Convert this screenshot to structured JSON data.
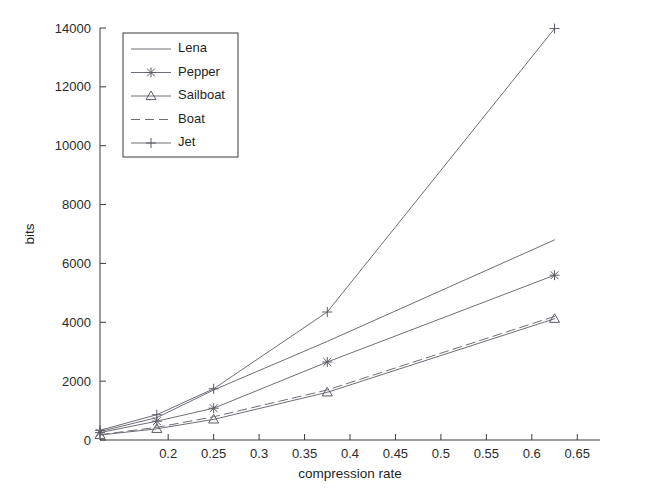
{
  "chart_data": {
    "type": "line",
    "title": "",
    "xlabel": "compression rate",
    "ylabel": "bits",
    "xlim": [
      0.125,
      0.675
    ],
    "ylim": [
      0,
      14000
    ],
    "xticks": [
      0.2,
      0.25,
      0.3,
      0.35,
      0.4,
      0.45,
      0.5,
      0.55,
      0.6,
      0.65
    ],
    "xtick_labels": [
      "0.2",
      "0.25",
      "0.3",
      "0.35",
      "0.4",
      "0.45",
      "0.5",
      "0.55",
      "0.6",
      "0.65"
    ],
    "yticks": [
      0,
      2000,
      4000,
      6000,
      8000,
      10000,
      12000,
      14000
    ],
    "ytick_labels": [
      "0",
      "2000",
      "4000",
      "6000",
      "8000",
      "10000",
      "12000",
      "14000"
    ],
    "grid": false,
    "legend_position": "upper-left",
    "x": [
      0.125,
      0.1875,
      0.25,
      0.375,
      0.625
    ],
    "series": [
      {
        "name": "Lena",
        "marker": "none",
        "linestyle": "solid",
        "color": "#6e6e78",
        "values": [
          290,
          760,
          1700,
          3350,
          6800
        ]
      },
      {
        "name": "Pepper",
        "marker": "star",
        "linestyle": "solid",
        "color": "#6e6e78",
        "values": [
          250,
          640,
          1080,
          2650,
          5600
        ]
      },
      {
        "name": "Sailboat",
        "marker": "triangle",
        "linestyle": "solid",
        "color": "#6e6e78",
        "values": [
          170,
          380,
          700,
          1620,
          4120
        ]
      },
      {
        "name": "Boat",
        "marker": "none",
        "linestyle": "dashed",
        "color": "#6e6e78",
        "values": [
          180,
          430,
          790,
          1700,
          4200
        ]
      },
      {
        "name": "Jet",
        "marker": "plus",
        "linestyle": "solid",
        "color": "#6e6e78",
        "values": [
          330,
          860,
          1740,
          4350,
          13980
        ]
      }
    ]
  },
  "axes": {
    "x_title": "compression rate",
    "y_title": "bits"
  },
  "legend": {
    "entries": [
      {
        "label": "Lena"
      },
      {
        "label": "Pepper"
      },
      {
        "label": "Sailboat"
      },
      {
        "label": "Boat"
      },
      {
        "label": "Jet"
      }
    ]
  },
  "colors": {
    "axis": "#3b3b3b",
    "series": "#6e6e78",
    "background": "#ffffff",
    "text": "#1f1f1f"
  }
}
